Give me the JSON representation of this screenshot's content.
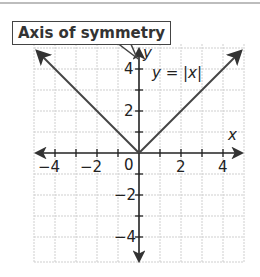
{
  "callout": {
    "label": "Axis of symmetry"
  },
  "equation": {
    "label": "y = |x|"
  },
  "axes": {
    "x_label": "x",
    "y_label": "y"
  },
  "x_ticks": [
    {
      "value": -4,
      "label": "−4"
    },
    {
      "value": -2,
      "label": "−2"
    },
    {
      "value": 0,
      "label": "0"
    },
    {
      "value": 2,
      "label": "2"
    },
    {
      "value": 4,
      "label": "4"
    }
  ],
  "y_ticks": [
    {
      "value": 4,
      "label": "4"
    },
    {
      "value": 2,
      "label": "2"
    },
    {
      "value": -2,
      "label": "−2"
    },
    {
      "value": -4,
      "label": "−4"
    }
  ],
  "colors": {
    "line": "#444444",
    "axis": "#222222",
    "grid": "#cccccc"
  }
}
